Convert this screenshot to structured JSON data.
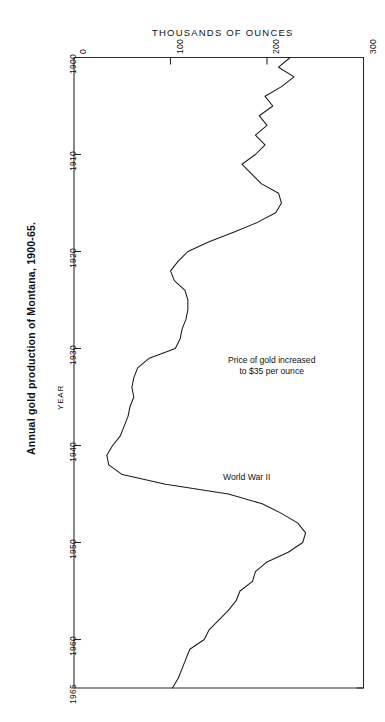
{
  "chart_data": {
    "type": "line",
    "title": "Annual gold production of Montana, 1900-65.",
    "xlabel": "THOUSANDS OF OUNCES",
    "ylabel": "YEAR",
    "orientation": "horizontal-value-axis-on-top",
    "grid": false,
    "legend": null,
    "xlim": [
      0,
      300
    ],
    "ylim": [
      1900,
      1965
    ],
    "xticks": [
      0,
      100,
      200,
      300
    ],
    "xtick_labels": [
      "0",
      "100",
      "200",
      "300"
    ],
    "yticks": [
      1900,
      1910,
      1920,
      1930,
      1940,
      1950,
      1960,
      1965
    ],
    "ytick_labels": [
      "1900",
      "1910",
      "1920",
      "1930",
      "1940",
      "1950",
      "1960",
      "1965"
    ],
    "series_name": "Gold production",
    "x": [
      1900,
      1901,
      1902,
      1903,
      1904,
      1905,
      1906,
      1907,
      1908,
      1909,
      1910,
      1911,
      1912,
      1913,
      1914,
      1915,
      1916,
      1917,
      1918,
      1919,
      1920,
      1921,
      1922,
      1923,
      1924,
      1925,
      1926,
      1927,
      1928,
      1929,
      1930,
      1931,
      1932,
      1933,
      1934,
      1935,
      1936,
      1937,
      1938,
      1939,
      1940,
      1941,
      1942,
      1943,
      1944,
      1945,
      1946,
      1947,
      1948,
      1949,
      1950,
      1951,
      1952,
      1953,
      1954,
      1955,
      1956,
      1957,
      1958,
      1959,
      1960,
      1961,
      1962,
      1963,
      1964,
      1965
    ],
    "values": [
      224,
      212,
      228,
      215,
      198,
      206,
      192,
      200,
      188,
      198,
      188,
      174,
      184,
      194,
      212,
      215,
      209,
      190,
      166,
      140,
      118,
      108,
      100,
      104,
      115,
      118,
      118,
      116,
      112,
      110,
      105,
      78,
      66,
      62,
      60,
      62,
      58,
      56,
      52,
      48,
      40,
      34,
      36,
      50,
      95,
      160,
      195,
      215,
      232,
      240,
      237,
      222,
      200,
      188,
      185,
      172,
      168,
      160,
      150,
      140,
      135,
      120,
      116,
      112,
      108,
      102
    ],
    "units": "thousands of ounces",
    "annotations": [
      {
        "text_line1": "Price of gold increased",
        "text_line2": "to $35 per ounce",
        "near_year": 1934
      },
      {
        "text_line1": "World War II",
        "text_line2": "",
        "near_year": 1943
      }
    ],
    "note": "Curve plotted with the value axis horizontal along the top and the year axis running downward."
  },
  "axes": {
    "top_axis_title": "THOUSANDS OF OUNCES",
    "left_axis_title": "YEAR"
  },
  "title": {
    "text": "Annual gold production of Montana, 1900-65."
  },
  "annotations": {
    "gold_price_line1": "Price of gold increased",
    "gold_price_line2": "to $35 per ounce",
    "world_war": "World War II"
  },
  "colors": {
    "line": "#1a1a1a",
    "frame": "#2b2b2b",
    "background": "#ffffff",
    "text": "#111111"
  }
}
